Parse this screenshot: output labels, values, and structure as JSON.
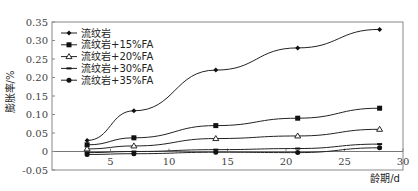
{
  "chart_data": {
    "type": "line",
    "title": "",
    "xlabel": "龄期/d",
    "ylabel": "膨胀率/%",
    "xlim": [
      0,
      30
    ],
    "ylim": [
      -0.05,
      0.35
    ],
    "x_ticks": [
      "5",
      "10",
      "15",
      "20",
      "25",
      "30"
    ],
    "y_ticks": [
      "0.35",
      "0.30",
      "0.25",
      "0.20",
      "0.15",
      "0.10",
      "0.05",
      "0",
      "-0.05"
    ],
    "grid": false,
    "legend_position": "upper-left",
    "x": [
      3,
      7,
      14,
      21,
      28
    ],
    "series": [
      {
        "name": "流纹岩",
        "marker": "diamond",
        "values": [
          0.03,
          0.11,
          0.22,
          0.28,
          0.33
        ]
      },
      {
        "name": "流纹岩+15%FA",
        "marker": "square",
        "values": [
          0.018,
          0.037,
          0.07,
          0.09,
          0.117
        ]
      },
      {
        "name": "流纹岩+20%FA",
        "marker": "triangle-open",
        "values": [
          0.007,
          0.015,
          0.035,
          0.042,
          0.06
        ]
      },
      {
        "name": "流纹岩+30%FA",
        "marker": "dash",
        "values": [
          -0.003,
          0.0,
          0.005,
          0.008,
          0.02
        ]
      },
      {
        "name": "流纹岩+35%FA",
        "marker": "circle",
        "values": [
          -0.008,
          -0.006,
          -0.002,
          -0.003,
          0.01
        ]
      }
    ]
  }
}
